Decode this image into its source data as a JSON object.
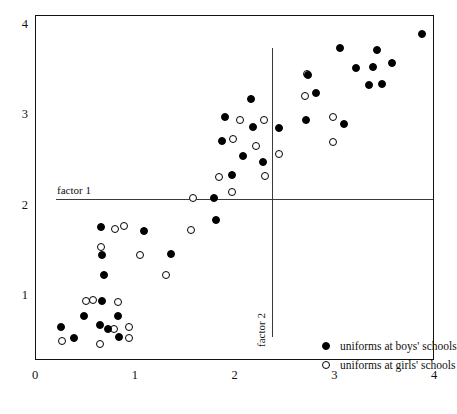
{
  "chart_data": {
    "type": "scatter",
    "title": "",
    "xlabel": "",
    "ylabel": "",
    "xlim": [
      0,
      4
    ],
    "ylim": [
      0,
      4
    ],
    "grid": false,
    "xticks": [
      "0",
      "1",
      "2",
      "3",
      "4"
    ],
    "xtick_values": [
      0,
      1,
      2,
      3,
      4
    ],
    "yticks": [
      "1",
      "2",
      "3",
      "4"
    ],
    "ytick_values": [
      1,
      2,
      3,
      4
    ],
    "legend_position": "bottom-right",
    "series": [
      {
        "name": "uniforms at boys' schools",
        "marker": "filled-circle",
        "color": "#000000",
        "points": [
          [
            0.25,
            0.66
          ],
          [
            0.38,
            0.54
          ],
          [
            0.48,
            0.78
          ],
          [
            0.64,
            0.68
          ],
          [
            0.66,
            0.95
          ],
          [
            0.68,
            1.23
          ],
          [
            0.66,
            1.45
          ],
          [
            0.65,
            1.76
          ],
          [
            0.72,
            0.63
          ],
          [
            0.82,
            0.78
          ],
          [
            0.83,
            0.55
          ],
          [
            1.08,
            1.72
          ],
          [
            1.35,
            1.47
          ],
          [
            1.78,
            2.08
          ],
          [
            1.8,
            1.84
          ],
          [
            1.86,
            2.72
          ],
          [
            1.89,
            2.98
          ],
          [
            1.96,
            2.34
          ],
          [
            2.08,
            2.55
          ],
          [
            2.16,
            3.18
          ],
          [
            2.18,
            2.87
          ],
          [
            2.28,
            2.48
          ],
          [
            2.44,
            2.86
          ],
          [
            2.71,
            2.95
          ],
          [
            2.73,
            3.45
          ],
          [
            2.81,
            3.25
          ],
          [
            3.05,
            3.75
          ],
          [
            3.09,
            2.9
          ],
          [
            3.21,
            3.52
          ],
          [
            3.34,
            3.34
          ],
          [
            3.38,
            3.53
          ],
          [
            3.42,
            3.72
          ],
          [
            3.47,
            3.35
          ],
          [
            3.57,
            3.58
          ],
          [
            3.87,
            3.9
          ]
        ]
      },
      {
        "name": "uniforms at girls' schools",
        "marker": "open-circle",
        "color": "#ffffff",
        "points": [
          [
            0.26,
            0.5
          ],
          [
            0.5,
            0.95
          ],
          [
            0.57,
            0.96
          ],
          [
            0.64,
            0.47
          ],
          [
            0.65,
            1.54
          ],
          [
            0.78,
            0.64
          ],
          [
            0.82,
            0.93
          ],
          [
            0.93,
            0.66
          ],
          [
            0.93,
            0.53
          ],
          [
            0.88,
            1.78
          ],
          [
            0.79,
            1.74
          ],
          [
            1.04,
            1.45
          ],
          [
            1.3,
            1.23
          ],
          [
            1.55,
            1.73
          ],
          [
            1.57,
            2.09
          ],
          [
            1.83,
            2.32
          ],
          [
            1.96,
            2.15
          ],
          [
            1.97,
            2.74
          ],
          [
            2.05,
            2.95
          ],
          [
            2.21,
            2.66
          ],
          [
            2.29,
            2.95
          ],
          [
            2.3,
            2.33
          ],
          [
            2.44,
            2.57
          ],
          [
            2.7,
            3.21
          ],
          [
            2.72,
            3.46
          ],
          [
            2.98,
            2.98
          ],
          [
            2.98,
            2.7
          ]
        ]
      }
    ],
    "reference_lines": [
      {
        "label": "factor 1",
        "orientation": "horizontal",
        "value": 2.07,
        "label_position": "left-above"
      },
      {
        "label": "factor 2",
        "orientation": "vertical",
        "value": 2.37,
        "label_position": "bottom-left"
      }
    ]
  }
}
